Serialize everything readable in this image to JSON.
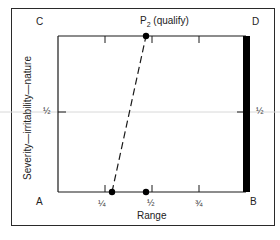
{
  "diagram": {
    "corners": {
      "top_left": "C",
      "top_right": "D",
      "bottom_left": "A",
      "bottom_right": "B"
    },
    "point_label": {
      "main": "P",
      "subscript": "2",
      "suffix": "(qualify)"
    },
    "x_axis": {
      "label": "Range",
      "ticks": [
        {
          "pos": 0.25,
          "label": "¼"
        },
        {
          "pos": 0.5,
          "label": "½"
        },
        {
          "pos": 0.75,
          "label": "¾"
        }
      ]
    },
    "y_axis": {
      "label": "Severity—irritability—nature",
      "half_label_left": "½",
      "half_label_right": "½"
    },
    "points": [
      {
        "name": "P2",
        "x": 0.47,
        "y": 1.0
      },
      {
        "name": "bottom-left-point",
        "x": 0.29,
        "y": 0.0
      },
      {
        "name": "bottom-mid-point",
        "x": 0.47,
        "y": 0.0
      }
    ],
    "dashed_line": {
      "from": [
        0.29,
        0.0
      ],
      "to": [
        0.47,
        1.0
      ]
    },
    "black_bar": {
      "side": "right",
      "x": 1.0
    },
    "colors": {
      "line": "#1a1a1a",
      "bar": "#000000",
      "half_line": "#cfcfcf"
    }
  }
}
